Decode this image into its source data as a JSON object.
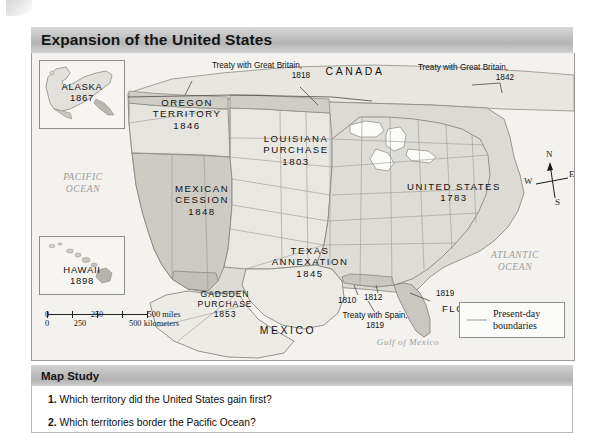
{
  "title": "Expansion of the United States",
  "map": {
    "insets": [
      {
        "name": "alaska",
        "label": "ALASKA",
        "year": "1867"
      },
      {
        "name": "hawaii",
        "label": "HAWAII",
        "year": "1898"
      }
    ],
    "oceans": [
      {
        "name": "pacific-ocean",
        "line1": "PACIFIC",
        "line2": "OCEAN"
      },
      {
        "name": "atlantic-ocean",
        "line1": "ATLANTIC",
        "line2": "OCEAN"
      },
      {
        "name": "gulf-of-mexico",
        "line1": "Gulf of Mexico",
        "line2": ""
      }
    ],
    "countries": [
      {
        "name": "canada",
        "label": "CANADA"
      },
      {
        "name": "mexico",
        "label": "MEXICO"
      }
    ],
    "territories": [
      {
        "name": "oregon-territory",
        "line1": "OREGON",
        "line2": "TERRITORY",
        "year": "1846"
      },
      {
        "name": "louisiana-purchase",
        "line1": "LOUISIANA",
        "line2": "PURCHASE",
        "year": "1803"
      },
      {
        "name": "mexican-cession",
        "line1": "MEXICAN",
        "line2": "CESSION",
        "year": "1848"
      },
      {
        "name": "texas-annexation",
        "line1": "TEXAS",
        "line2": "ANNEXATION",
        "year": "1845"
      },
      {
        "name": "gadsden-purchase",
        "line1": "GADSDEN",
        "line2": "PURCHASE",
        "year": "1853"
      },
      {
        "name": "united-states",
        "line1": "UNITED STATES",
        "line2": "",
        "year": "1783"
      },
      {
        "name": "florida",
        "line1": "FLORIDA",
        "line2": "",
        "year": ""
      }
    ],
    "annotations": [
      {
        "name": "treaty-great-britain-1818",
        "line1": "Treaty with Great Britain,",
        "line2": "1818"
      },
      {
        "name": "treaty-great-britain-1842",
        "line1": "Treaty with Great Britain,",
        "line2": "1842"
      },
      {
        "name": "treaty-spain-1819",
        "line1": "Treaty with Spain,",
        "line2": "1819"
      }
    ],
    "year_marks": [
      {
        "name": "year-1810",
        "label": "1810"
      },
      {
        "name": "year-1812",
        "label": "1812"
      },
      {
        "name": "year-1819",
        "label": "1819"
      }
    ],
    "compass": {
      "north": "N",
      "east": "E",
      "south": "S",
      "west": "W"
    },
    "scale": {
      "miles": {
        "t0": "0",
        "t1": "250",
        "t2": "500 miles"
      },
      "kilometers": {
        "t0": "0",
        "t1": "250",
        "t2": "500 kilometers"
      }
    },
    "legend": {
      "line1": "Present-day",
      "line2": "boundaries"
    }
  },
  "study": {
    "heading": "Map Study",
    "questions": [
      {
        "num": "1.",
        "text": "Which territory did the United States gain first?"
      },
      {
        "num": "2.",
        "text": "Which territories border the Pacific Ocean?"
      }
    ]
  },
  "colors": {
    "title_band": "#c3c3c3",
    "map_bg": "#f3f2ef",
    "land_light": "#eceae5",
    "land_mid": "#dcdad4",
    "land_dark": "#c9c7c0",
    "ocean_text": "#9d9d9d",
    "border": "#8d8d8d"
  }
}
